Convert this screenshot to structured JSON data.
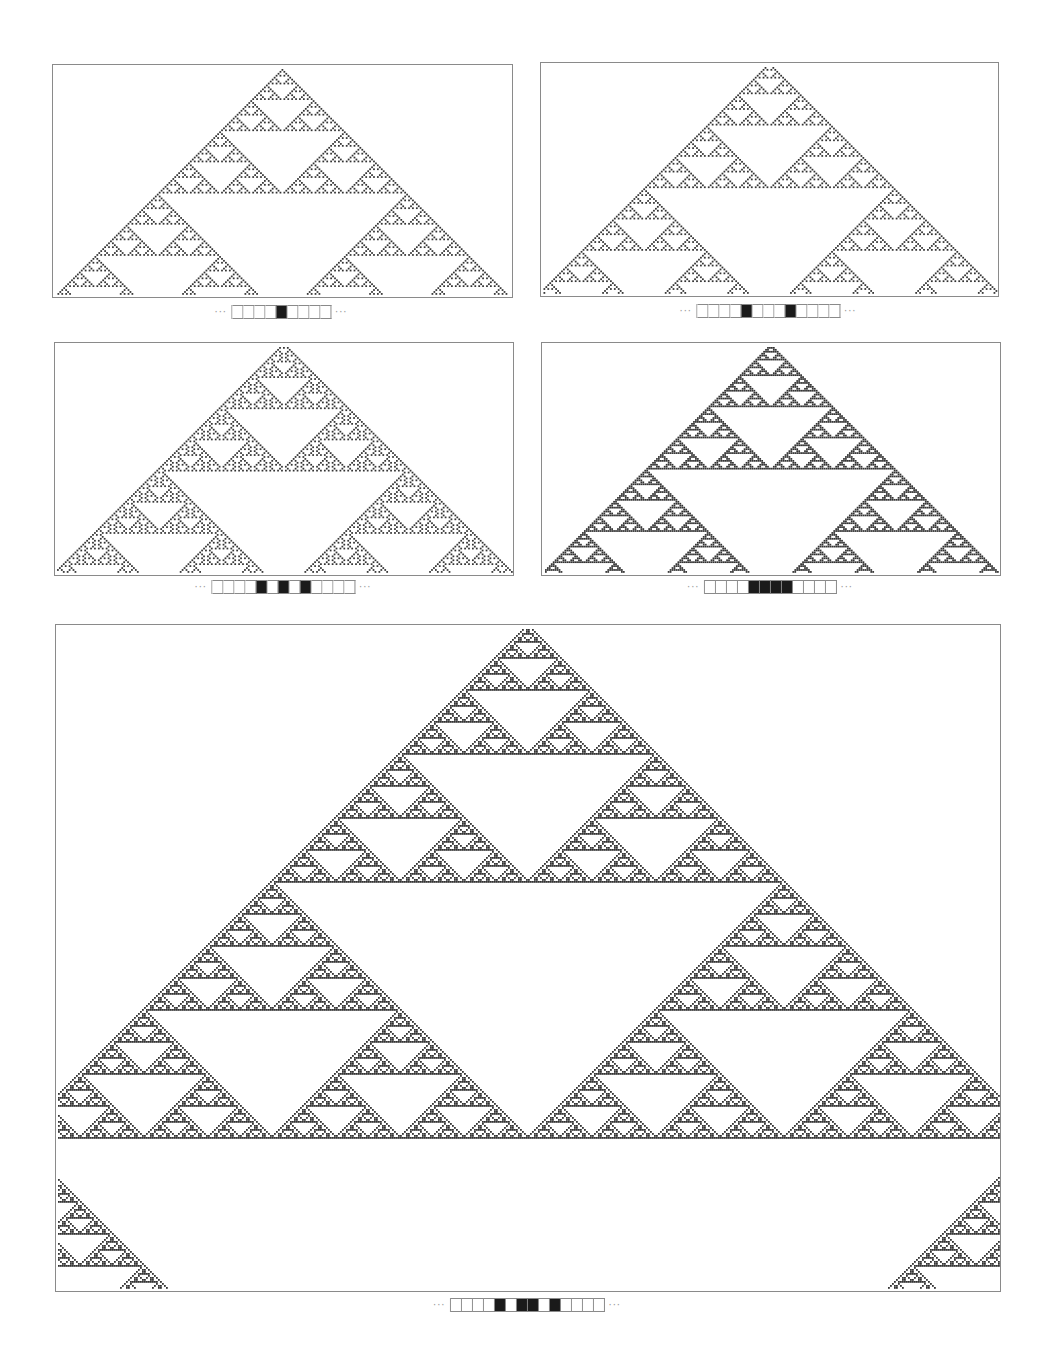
{
  "figure": {
    "rule": 90,
    "cell_color": "#333333",
    "border_color": "#8a8a8a",
    "ellipsis": "···",
    "panels": [
      {
        "id": "panel-1",
        "box": {
          "x": 52,
          "y": 64,
          "w": 461,
          "h": 234
        },
        "label_center": {
          "x": 281,
          "y": 305
        },
        "initial_condition": [
          0,
          0,
          0,
          0,
          1,
          0,
          0,
          0,
          0
        ],
        "steps": 116
      },
      {
        "id": "panel-2",
        "box": {
          "x": 540,
          "y": 62,
          "w": 459,
          "h": 235
        },
        "label_center": {
          "x": 768,
          "y": 304
        },
        "initial_condition": [
          0,
          0,
          0,
          0,
          1,
          0,
          0,
          0,
          1,
          0,
          0,
          0,
          0
        ],
        "steps": 116
      },
      {
        "id": "panel-3",
        "box": {
          "x": 54,
          "y": 342,
          "w": 460,
          "h": 234
        },
        "label_center": {
          "x": 283,
          "y": 580
        },
        "initial_condition": [
          0,
          0,
          0,
          0,
          1,
          0,
          1,
          0,
          1,
          0,
          0,
          0,
          0
        ],
        "steps": 116
      },
      {
        "id": "panel-4",
        "box": {
          "x": 541,
          "y": 342,
          "w": 460,
          "h": 234
        },
        "label_center": {
          "x": 770,
          "y": 580
        },
        "initial_condition": [
          0,
          0,
          0,
          0,
          1,
          1,
          1,
          1,
          0,
          0,
          0,
          0
        ],
        "steps": 116
      },
      {
        "id": "panel-5",
        "box": {
          "x": 55,
          "y": 624,
          "w": 946,
          "h": 668
        },
        "label_center": {
          "x": 527,
          "y": 1298
        },
        "initial_condition": [
          0,
          0,
          0,
          0,
          1,
          0,
          1,
          1,
          0,
          1,
          0,
          0,
          0,
          0
        ],
        "steps": 330
      }
    ]
  }
}
